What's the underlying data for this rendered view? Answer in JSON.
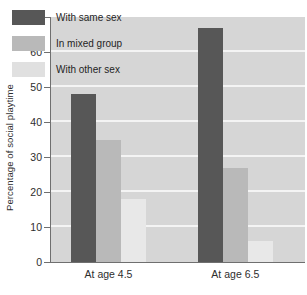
{
  "chart_data": {
    "type": "bar",
    "title": "",
    "xlabel": "",
    "ylabel": "Percentage of social playtime",
    "ylim": [
      0,
      70
    ],
    "yticks": [
      0,
      10,
      20,
      30,
      40,
      50,
      60,
      70
    ],
    "ytick_labels": [
      "0",
      "10",
      "20",
      "30",
      "40",
      "50",
      "60",
      "70"
    ],
    "grid": true,
    "grid_axis": "y",
    "legend_position": "top-left-inside",
    "categories": [
      "At age 4.5",
      "At age 6.5"
    ],
    "series": [
      {
        "name": "With same sex",
        "color": "#575757",
        "values": [
          48,
          67
        ]
      },
      {
        "name": "In mixed group",
        "color": "#b9b9b9",
        "values": [
          35,
          27
        ]
      },
      {
        "name": "With other sex",
        "color": "#e8e8e8",
        "values": [
          18,
          6
        ]
      }
    ]
  },
  "colors": {
    "plot_background": "#d6d6d6",
    "page_background": "#ffffff",
    "gridline": "#f4f4f4",
    "axis": "#6f6f6f",
    "text": "#2e2e2e"
  }
}
